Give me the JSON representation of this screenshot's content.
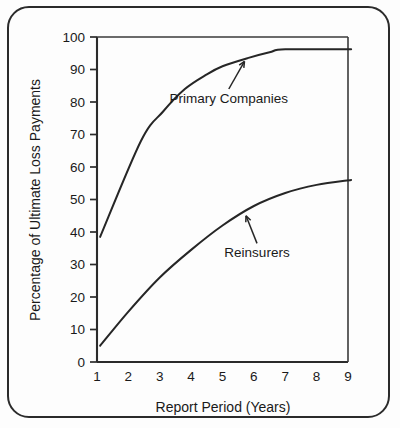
{
  "chart_data": {
    "type": "line",
    "title": "",
    "xlabel": "Report Period (Years)",
    "ylabel": "Percentage of Ultimate Loss Payments",
    "xlim": [
      1,
      9
    ],
    "ylim": [
      0,
      100
    ],
    "grid": false,
    "legend_position": "inline-annotations",
    "xticks": [
      "1",
      "2",
      "3",
      "4",
      "5",
      "6",
      "7",
      "8",
      "9"
    ],
    "yticks": [
      "0",
      "10",
      "20",
      "30",
      "40",
      "50",
      "60",
      "70",
      "80",
      "90",
      "100"
    ],
    "series": [
      {
        "name": "Primary Companies",
        "x": [
          1.1,
          2.4,
          3.1,
          3.8,
          4.5,
          5.0,
          5.8,
          6.5,
          7.0,
          9.1
        ],
        "values": [
          38.5,
          68.0,
          77.0,
          84.0,
          88.5,
          91.0,
          93.5,
          95.3,
          96.2,
          96.2
        ],
        "annotation": {
          "label": "Primary Companies",
          "pointer_from_x": 5.2,
          "pointer_from_y": 84.0,
          "pointer_to_x": 5.7,
          "pointer_to_y": 92.5
        }
      },
      {
        "name": "Reinsurers",
        "x": [
          1.1,
          2.0,
          3.0,
          4.0,
          5.0,
          6.0,
          7.0,
          8.0,
          9.1
        ],
        "values": [
          5.0,
          15.5,
          26.0,
          34.5,
          42.0,
          48.0,
          52.0,
          54.5,
          56.0
        ],
        "annotation": {
          "label": "Reinsurers",
          "pointer_from_x": 6.1,
          "pointer_from_y": 36.5,
          "pointer_to_x": 5.75,
          "pointer_to_y": 45.0
        }
      }
    ]
  },
  "axes": {
    "x_title": "Report Period (Years)",
    "y_title": "Percentage of Ultimate Loss Payments"
  },
  "annotations": {
    "primary_label": "Primary Companies",
    "reinsurers_label": "Reinsurers"
  },
  "colors": {
    "line": "#262626",
    "axis": "#2b2b2b",
    "background": "#fdfdfd",
    "border": "#2b2b2b"
  }
}
